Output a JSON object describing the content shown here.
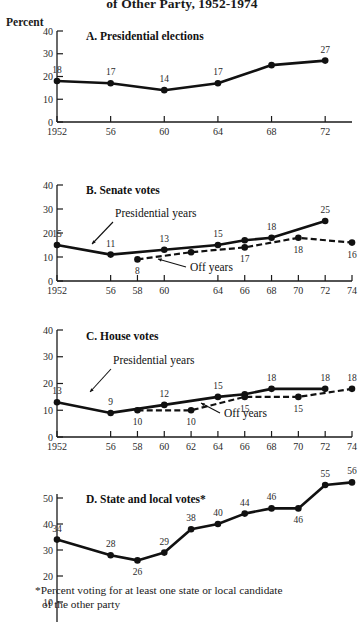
{
  "figure": {
    "title": "of Other Party, 1952-1974",
    "axis_unit_label": "Percent",
    "footnote_line1": "*Percent voting for at least one state or local candidate",
    "footnote_line2": "of the other party"
  },
  "legend": {
    "presidential_years": "Presidential years",
    "off_years": "Off  years"
  },
  "chart_data": [
    {
      "type": "line",
      "panel": "A",
      "title": "A.  Presidential elections",
      "xlabel": "",
      "ylabel": "Percent",
      "ylim": [
        0,
        40
      ],
      "yticks": [
        0,
        10,
        20,
        30,
        40
      ],
      "ytick_labels": [
        "0",
        "10",
        "20",
        "30",
        "40"
      ],
      "grid": false,
      "legend_position": "none",
      "xlim": [
        1952,
        1974
      ],
      "xticks": [
        1952,
        1956,
        1960,
        1964,
        1968,
        1972
      ],
      "xtick_labels": [
        "1952",
        "56",
        "60",
        "64",
        "68",
        "72"
      ],
      "series": [
        {
          "name": "Presidential years",
          "style": "solid",
          "x": [
            1952,
            1956,
            1960,
            1964,
            1968,
            1972
          ],
          "values": [
            18,
            17,
            14,
            17,
            25,
            27
          ],
          "point_labels": [
            "18",
            "17",
            "14",
            "17",
            "",
            "27"
          ],
          "label_positions": [
            "above",
            "above",
            "above",
            "above",
            "none",
            "above"
          ]
        }
      ]
    },
    {
      "type": "line",
      "panel": "B",
      "title": "B.  Senate votes",
      "xlabel": "",
      "ylabel": "Percent",
      "ylim": [
        0,
        40
      ],
      "yticks": [
        0,
        10,
        20,
        30,
        40
      ],
      "ytick_labels": [
        "0",
        "10",
        "20",
        "30",
        "40"
      ],
      "grid": false,
      "legend_position": "inline-annotations",
      "xlim": [
        1952,
        1974
      ],
      "xticks": [
        1952,
        1956,
        1958,
        1960,
        1964,
        1966,
        1968,
        1970,
        1972,
        1974
      ],
      "xtick_labels": [
        "1952",
        "56",
        "58",
        "60",
        "64",
        "66",
        "68",
        "70",
        "72",
        "74"
      ],
      "series": [
        {
          "name": "Presidential years",
          "style": "solid",
          "x": [
            1952,
            1956,
            1960,
            1964,
            1966,
            1968,
            1972
          ],
          "values": [
            15,
            11,
            13,
            15,
            17,
            18,
            25
          ],
          "point_labels": [
            "15",
            "11",
            "13",
            "15",
            "",
            "18",
            "25"
          ],
          "label_positions": [
            "above",
            "above",
            "above",
            "above",
            "none",
            "above",
            "above"
          ]
        },
        {
          "name": "Off years",
          "style": "dashed",
          "x": [
            1958,
            1962,
            1966,
            1970,
            1974
          ],
          "values": [
            9,
            12,
            14,
            18,
            16
          ],
          "point_labels": [
            "8",
            "",
            "17",
            "18",
            "16"
          ],
          "label_positions": [
            "below",
            "none",
            "below",
            "below",
            "below"
          ]
        }
      ]
    },
    {
      "type": "line",
      "panel": "C",
      "title": "C.  House votes",
      "xlabel": "",
      "ylabel": "Percent",
      "ylim": [
        0,
        40
      ],
      "yticks": [
        0,
        10,
        20,
        30,
        40
      ],
      "ytick_labels": [
        "0",
        "10",
        "20",
        "30",
        "40"
      ],
      "grid": false,
      "legend_position": "inline-annotations",
      "xlim": [
        1952,
        1974
      ],
      "xticks": [
        1952,
        1956,
        1958,
        1960,
        1962,
        1964,
        1966,
        1968,
        1970,
        1972,
        1974
      ],
      "xtick_labels": [
        "1952",
        "56",
        "58",
        "60",
        "62",
        "64",
        "66",
        "68",
        "70",
        "72",
        "74"
      ],
      "series": [
        {
          "name": "Presidential years",
          "style": "solid",
          "x": [
            1952,
            1956,
            1960,
            1964,
            1966,
            1968,
            1972
          ],
          "values": [
            13,
            9,
            12,
            15,
            16,
            18,
            18
          ],
          "point_labels": [
            "13",
            "9",
            "12",
            "15",
            "",
            "18",
            "18"
          ],
          "label_positions": [
            "above",
            "above",
            "above",
            "above",
            "none",
            "above",
            "above"
          ]
        },
        {
          "name": "Off years",
          "style": "dashed",
          "x": [
            1958,
            1962,
            1966,
            1970,
            1974
          ],
          "values": [
            10,
            10,
            15,
            15,
            18
          ],
          "point_labels": [
            "10",
            "10",
            "15",
            "15",
            "18"
          ],
          "label_positions": [
            "below",
            "below",
            "below",
            "below",
            "above"
          ]
        }
      ]
    },
    {
      "type": "line",
      "panel": "D",
      "title": "D.   State and local votes*",
      "xlabel": "",
      "ylabel": "Percent",
      "ylim": [
        0,
        56
      ],
      "yticks": [
        10,
        20,
        30,
        40,
        50
      ],
      "ytick_labels": [
        "10",
        "20",
        "30",
        "40",
        "50"
      ],
      "grid": false,
      "legend_position": "none",
      "xlim": [
        1952,
        1974
      ],
      "xticks": [
        1952,
        1956,
        1958,
        1960,
        1962,
        1964,
        1966,
        1968,
        1970,
        1972,
        1974
      ],
      "xtick_labels": [],
      "series": [
        {
          "name": "State and local votes",
          "style": "solid",
          "x": [
            1952,
            1956,
            1958,
            1960,
            1962,
            1964,
            1966,
            1968,
            1970,
            1972,
            1974
          ],
          "values": [
            34,
            28,
            26,
            29,
            38,
            40,
            44,
            46,
            46,
            55,
            56
          ],
          "point_labels": [
            "34",
            "28",
            "26",
            "29",
            "38",
            "40",
            "44",
            "46",
            "46",
            "55",
            "56"
          ],
          "label_positions": [
            "above",
            "above",
            "below",
            "above",
            "above",
            "above",
            "above",
            "above",
            "below",
            "above",
            "above"
          ]
        }
      ]
    }
  ]
}
